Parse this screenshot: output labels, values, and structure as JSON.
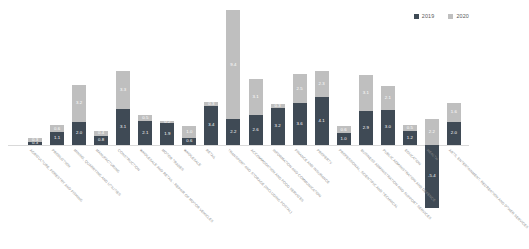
{
  "chart_data": {
    "type": "bar",
    "subtype": "stacked-column",
    "title": "",
    "subtitle": "",
    "xlabel": "",
    "ylabel": "",
    "grid": false,
    "legend_position": "top-right",
    "ylim": [
      -5.5,
      13.5
    ],
    "categories": [
      "AGRICULTURE, FORESTRY AND FISHING",
      "PRODUCTION",
      "MINING, QUARRYING AND UTILITIES",
      "MANUFACTURING",
      "CONSTRUCTION",
      "WHOLESALE AND RETAIL - REPAIR OF MOTOR VEHICLES",
      "MOTOR TRADES",
      "WHOLESALE",
      "RETAIL",
      "TRANSPORT AND STORAGE (INCLUDING POSTAL)",
      "ACCOMMODATION AND FOOD SERVICES",
      "INFORMATION AND COMMUNICATION",
      "FINANCE AND INSURANCE",
      "PROPERTY",
      "PROFESSIONAL, SCIENTIFIC AND TECHNICAL",
      "BUSINESS ADMINISTRATION AND SUPPORT SERVICES",
      "PUBLIC ADMINISTRATION AND DEFENCE",
      "EDUCATION",
      "HEALTH",
      "ARTS, ENTERTAINMENT, RECREATION AND OTHER SERVICES"
    ],
    "series": [
      {
        "name": "2019",
        "color": "#3f4a55",
        "values": [
          0.3,
          1.1,
          2.0,
          0.8,
          3.1,
          2.1,
          1.9,
          0.6,
          3.4,
          2.2,
          2.6,
          3.2,
          3.6,
          4.1,
          1.0,
          2.9,
          3.0,
          1.2,
          -5.4,
          2.0
        ]
      },
      {
        "name": "2020",
        "color": "#bfbfbf",
        "values": [
          0.3,
          0.6,
          3.2,
          0.4,
          3.3,
          0.5,
          0.2,
          1.0,
          0.3,
          9.4,
          3.1,
          0.3,
          2.5,
          2.3,
          0.6,
          3.1,
          2.1,
          0.5,
          2.2,
          1.6
        ]
      }
    ],
    "bar_labels_2019": [
      "0.3",
      "1.1",
      "2.0",
      "0.8",
      "3.1",
      "2.1",
      "1.9",
      "0.6",
      "3.4",
      "2.2",
      "2.6",
      "3.2",
      "3.6",
      "4.1",
      "1.0",
      "2.9",
      "3.0",
      "1.2",
      "-5.4",
      "2.0"
    ],
    "bar_labels_2020": [
      "0.3",
      "0.6",
      "3.2",
      "0.4",
      "3.3",
      "0.5",
      "0.2",
      "1.0",
      "0.3",
      "9.4",
      "3.1",
      "0.3",
      "2.5",
      "2.3",
      "0.6",
      "3.1",
      "2.1",
      "0.5",
      "2.2",
      "1.6"
    ]
  },
  "legend": {
    "items": [
      {
        "label": "2019",
        "color": "#3f4a55"
      },
      {
        "label": "2020",
        "color": "#bfbfbf"
      }
    ]
  }
}
